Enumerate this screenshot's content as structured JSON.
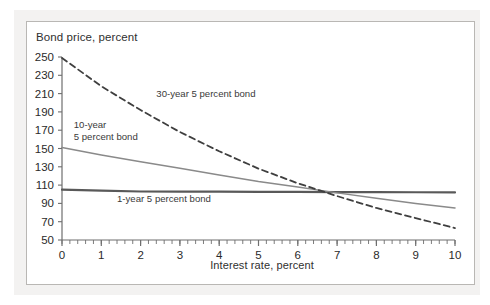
{
  "figure": {
    "title": "Bond price, percent",
    "xaxis_title": "Interest rate, percent"
  },
  "colors": {
    "background": "#ffffff",
    "page_backdrop": "#f3f2f1",
    "frame_border": "#b9b7b4",
    "axis": "#6e6e6e",
    "text": "#2a2a2a",
    "series_1year": "#595959",
    "series_10year": "#8a8a8a",
    "series_30year": "#3f3f3f"
  },
  "annotations": {
    "thirty_year": "30-year 5 percent bond",
    "ten_year_line1": "10-year",
    "ten_year_line2": "5 percent bond",
    "one_year": "1-year 5 percent bond"
  },
  "chart_data": {
    "type": "line",
    "title": "Bond price, percent",
    "xlabel": "Interest rate, percent",
    "ylabel": "Bond price, percent",
    "xlim": [
      0,
      10
    ],
    "ylim": [
      50,
      250
    ],
    "yticks": [
      50,
      70,
      90,
      110,
      130,
      150,
      170,
      190,
      210,
      230,
      250
    ],
    "xticks": [
      0,
      1,
      2,
      3,
      4,
      5,
      6,
      7,
      8,
      9,
      10
    ],
    "xminor_tick_interval": 0.2,
    "grid": false,
    "legend": "inline-annotations",
    "x": [
      0,
      1,
      2,
      3,
      4,
      5,
      6,
      7,
      8,
      9,
      10
    ],
    "series": [
      {
        "name": "1-year 5 percent bond",
        "style": "solid",
        "color": "#595959",
        "width": 2.2,
        "values": [
          105.0,
          104.0,
          103.0,
          102.9,
          102.8,
          102.6,
          102.5,
          102.4,
          102.3,
          102.2,
          102.0
        ]
      },
      {
        "name": "10-year 5 percent bond",
        "style": "solid",
        "color": "#8a8a8a",
        "width": 1.5,
        "values": [
          151.0,
          143.0,
          135.5,
          128.5,
          121.0,
          114.0,
          108.0,
          101.5,
          95.5,
          90.0,
          85.0
        ]
      },
      {
        "name": "30-year 5 percent bond",
        "style": "dashed",
        "color": "#3f3f3f",
        "width": 1.8,
        "values": [
          249.0,
          218.0,
          192.0,
          168.0,
          147.0,
          128.0,
          112.0,
          98.0,
          85.0,
          74.0,
          63.0
        ]
      }
    ],
    "annotations": [
      {
        "text": "30-year 5 percent bond",
        "x": 2.4,
        "y": 206
      },
      {
        "text": "10-year",
        "x": 0.3,
        "y": 172
      },
      {
        "text": "5 percent bond",
        "x": 0.3,
        "y": 159
      },
      {
        "text": "1-year 5 percent bond",
        "x": 1.4,
        "y": 92
      }
    ]
  }
}
